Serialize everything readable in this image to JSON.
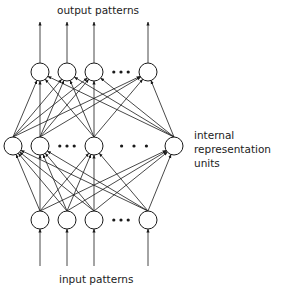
{
  "diagram": {
    "title_top": "output patterns",
    "title_bottom": "input patterns",
    "side_label_lines": [
      "internal",
      "representation",
      "units"
    ],
    "colors": {
      "stroke": "#1a1a1a",
      "text": "#222222",
      "background": "#ffffff"
    },
    "layers": {
      "output": {
        "nodes_x": [
          40,
          67,
          94,
          148
        ],
        "y": 72,
        "ellipsis_after_index": 2
      },
      "internal": {
        "nodes_x": [
          13,
          40,
          94,
          174
        ],
        "y": 146,
        "ellipsis_after_indices": [
          1,
          2
        ]
      },
      "input": {
        "nodes_x": [
          40,
          67,
          94,
          148
        ],
        "y": 220,
        "ellipsis_after_index": 2
      }
    },
    "node_radius": 9
  }
}
